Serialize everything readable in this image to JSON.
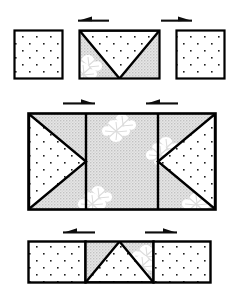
{
  "figure": {
    "type": "folding-sequence-diagram",
    "title": "",
    "stage_count": 3,
    "colors": {
      "outline": "#000000",
      "dotted_fill": "#ffffff",
      "dot": "#1a1a1a",
      "gray_fill": "#d9d9d9",
      "gray_fill_dark": "#cfcfcf",
      "blob_fill": "#ffffff",
      "background": "#ffffff"
    },
    "legend": {
      "dotted_region": "dotted-texture-face",
      "gray_region": "gray-texture-face",
      "blob": "white-splotch-motif"
    }
  },
  "stages": [
    {
      "id": "stage-top",
      "name": "stage-1-unfolded",
      "arrows": [
        {
          "id": "arrow-top-left",
          "direction": "left",
          "label": ""
        },
        {
          "id": "arrow-top-right",
          "direction": "right",
          "label": ""
        }
      ],
      "panels": [
        {
          "id": "panel-top-left",
          "shape": "square",
          "fill": "dotted"
        },
        {
          "id": "panel-top-center",
          "shape": "rectangle",
          "fill": "mixed",
          "motif": "inverted-triangle-dotted-with-gray-corners"
        },
        {
          "id": "panel-top-right",
          "shape": "square",
          "fill": "dotted"
        }
      ]
    },
    {
      "id": "stage-middle",
      "name": "stage-2-open",
      "arrows": [
        {
          "id": "arrow-middle-left",
          "direction": "right",
          "label": ""
        },
        {
          "id": "arrow-middle-right",
          "direction": "left",
          "label": ""
        }
      ],
      "panels": [
        {
          "id": "panel-middle-left",
          "shape": "rectangle",
          "fill": "mixed",
          "motif": "right-pointing-dotted-triangle"
        },
        {
          "id": "panel-middle-center",
          "shape": "rectangle",
          "fill": "gray",
          "motif": "white-splotches"
        },
        {
          "id": "panel-middle-right",
          "shape": "rectangle",
          "fill": "mixed",
          "motif": "left-pointing-dotted-triangle"
        }
      ]
    },
    {
      "id": "stage-bottom",
      "name": "stage-3-folded",
      "arrows": [
        {
          "id": "arrow-bottom-left",
          "direction": "left",
          "label": ""
        },
        {
          "id": "arrow-bottom-right",
          "direction": "right",
          "label": ""
        }
      ],
      "panels": [
        {
          "id": "panel-bottom-left",
          "shape": "rectangle",
          "fill": "dotted"
        },
        {
          "id": "panel-bottom-center",
          "shape": "rectangle",
          "fill": "mixed",
          "motif": "upward-triangle-dotted-with-gray-corners"
        },
        {
          "id": "panel-bottom-right",
          "shape": "rectangle",
          "fill": "dotted"
        }
      ]
    }
  ]
}
